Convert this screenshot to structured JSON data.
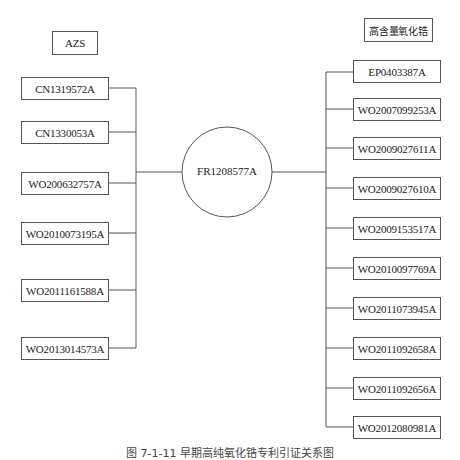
{
  "diagram": {
    "center": {
      "label": "FR1208577A"
    },
    "left_group": {
      "title": "AZS",
      "items": [
        {
          "label": "CN1319572A"
        },
        {
          "label": "CN1330053A"
        },
        {
          "label": "WO200632757A"
        },
        {
          "label": "WO2010073195A"
        },
        {
          "label": "WO2011161588A"
        },
        {
          "label": "WO2013014573A"
        }
      ]
    },
    "right_group": {
      "title": "高含量氧化锆",
      "items": [
        {
          "label": "EP0403387A"
        },
        {
          "label": "WO2007099253A"
        },
        {
          "label": "WO2009027611A"
        },
        {
          "label": "WO2009027610A"
        },
        {
          "label": "WO2009153517A"
        },
        {
          "label": "WO2010097769A"
        },
        {
          "label": "WO2011073945A"
        },
        {
          "label": "WO2011092658A"
        },
        {
          "label": "WO2011092656A"
        },
        {
          "label": "WO2012080981A"
        }
      ]
    },
    "caption": "图 7-1-11 早期高纯氧化锆专利引证关系图"
  }
}
